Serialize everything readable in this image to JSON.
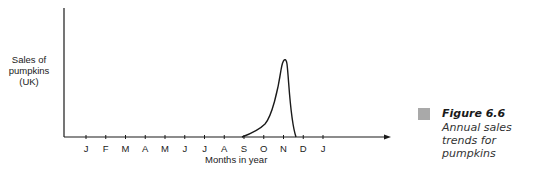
{
  "chart_data": {
    "type": "line",
    "title": "",
    "xlabel": "Months in year",
    "ylabel": "Sales of pumpkins (UK)",
    "categories": [
      "J",
      "F",
      "M",
      "A",
      "M",
      "J",
      "J",
      "A",
      "S",
      "O",
      "N",
      "D",
      "J"
    ],
    "series": [
      {
        "name": "Pumpkin sales",
        "values": [
          0,
          0,
          0,
          0,
          0,
          0,
          0,
          0,
          0,
          15,
          95,
          0,
          0
        ]
      }
    ],
    "ylim": [
      0,
      100
    ],
    "grid": false,
    "legend": "none",
    "annotations": [
      "Curve rises from S, peaks just before N, drops to zero between N and D"
    ]
  },
  "ylabel_lines": [
    "Sales of",
    "pumpkins",
    "(UK)"
  ],
  "caption": {
    "figure_number": "Figure 6.6",
    "text": "Annual sales trends for pumpkins",
    "swatch_color": "#a9a9a9"
  }
}
